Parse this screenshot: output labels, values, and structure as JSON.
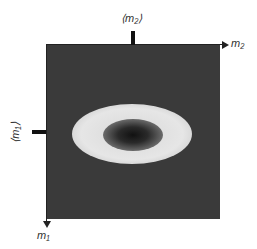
{
  "diagram": {
    "labels": {
      "mean_m2": "⟨m₂⟩",
      "axis_m2": "m₂",
      "mean_m1": "⟨m₁⟩",
      "axis_m1": "m₁"
    },
    "colors": {
      "background": "#3a3a3a",
      "ring": "#e6e6e6",
      "center": "#111111"
    }
  }
}
